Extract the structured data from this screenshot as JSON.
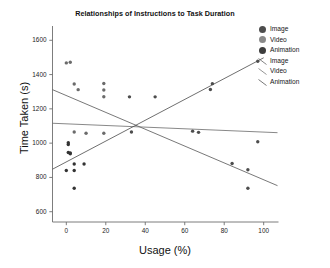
{
  "chart_data": {
    "type": "scatter",
    "title": "Relationships of Instructions to Task Duration",
    "xlabel": "Usage (%)",
    "ylabel": "Time Taken (s)",
    "xlim": [
      -7,
      107
    ],
    "ylim": [
      540,
      1660
    ],
    "xticks": [
      0,
      20,
      40,
      60,
      80,
      100
    ],
    "yticks": [
      600,
      800,
      1000,
      1200,
      1400,
      1600
    ],
    "xtick_labels": [
      "0",
      "20",
      "40",
      "60",
      "80",
      "100"
    ],
    "ytick_labels": [
      "600",
      "800",
      "1000",
      "1200",
      "1400",
      "1600"
    ],
    "grid": false,
    "legend_position": "right-top",
    "series": [
      {
        "name": "Image",
        "kind": "markers",
        "color": "#4d4d4d",
        "points": [
          {
            "x": 64,
            "y": 1070
          },
          {
            "x": 67,
            "y": 1063
          },
          {
            "x": 74,
            "y": 1347
          },
          {
            "x": 73,
            "y": 1313
          },
          {
            "x": 84,
            "y": 881
          },
          {
            "x": 92,
            "y": 845
          },
          {
            "x": 92,
            "y": 737
          },
          {
            "x": 97,
            "y": 1478
          },
          {
            "x": 97,
            "y": 1008
          },
          {
            "x": 45,
            "y": 1270
          },
          {
            "x": 32,
            "y": 1270
          },
          {
            "x": 33,
            "y": 1065
          }
        ]
      },
      {
        "name": "Video",
        "kind": "markers",
        "color": "#6b6b6b",
        "points": [
          {
            "x": 0,
            "y": 1468
          },
          {
            "x": 2,
            "y": 1472
          },
          {
            "x": 4,
            "y": 1345
          },
          {
            "x": 6,
            "y": 1312
          },
          {
            "x": 19,
            "y": 1348
          },
          {
            "x": 19,
            "y": 1310
          },
          {
            "x": 19,
            "y": 1271
          },
          {
            "x": 4,
            "y": 1065
          },
          {
            "x": 10,
            "y": 1058
          },
          {
            "x": 19,
            "y": 1058
          }
        ]
      },
      {
        "name": "Animation",
        "kind": "markers",
        "color": "#333333",
        "points": [
          {
            "x": 1,
            "y": 1003
          },
          {
            "x": 1,
            "y": 992
          },
          {
            "x": 1,
            "y": 945
          },
          {
            "x": 2,
            "y": 943
          },
          {
            "x": 2,
            "y": 938
          },
          {
            "x": 0,
            "y": 840
          },
          {
            "x": 4,
            "y": 878
          },
          {
            "x": 4,
            "y": 840
          },
          {
            "x": 9,
            "y": 878
          },
          {
            "x": 4,
            "y": 737
          }
        ]
      },
      {
        "name": "Image",
        "kind": "line",
        "color": "#555555",
        "endpoints": [
          {
            "x": -7,
            "y": 1312
          },
          {
            "x": 107,
            "y": 752
          }
        ]
      },
      {
        "name": "Video",
        "kind": "line",
        "color": "#6a6a6a",
        "endpoints": [
          {
            "x": -7,
            "y": 1116
          },
          {
            "x": 107,
            "y": 1061
          }
        ]
      },
      {
        "name": "Animation",
        "kind": "line",
        "color": "#4a4a4a",
        "endpoints": [
          {
            "x": -7,
            "y": 848
          },
          {
            "x": 100,
            "y": 1498
          }
        ]
      }
    ]
  },
  "legend": {
    "items": [
      {
        "label": "Image",
        "type": "dot",
        "color": "#4d4d4d"
      },
      {
        "label": "Video",
        "type": "dot",
        "color": "#8a8a8a"
      },
      {
        "label": "Animation",
        "type": "dot",
        "color": "#3d3d3d"
      },
      {
        "label": "Image",
        "type": "line",
        "color": "#666666"
      },
      {
        "label": "Video",
        "type": "line",
        "color": "#7a7a7a"
      },
      {
        "label": "Animation",
        "type": "line",
        "color": "#555555"
      }
    ]
  },
  "axes": {
    "axis_color": "#6e6e6e"
  }
}
